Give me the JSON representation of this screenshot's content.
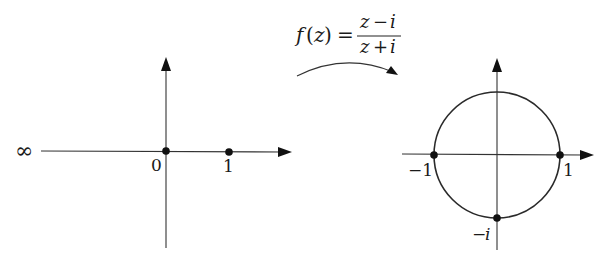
{
  "mapping": {
    "function_name": "f(z)",
    "lhs_f": "f",
    "lhs_arg": "z",
    "equals": "=",
    "numerator": "z − i",
    "numerator_parts": [
      "z",
      "−",
      "i"
    ],
    "denominator": "z + i",
    "denominator_parts": [
      "z",
      "+",
      "i"
    ],
    "arrow_direction": "left-to-right"
  },
  "domain_plane": {
    "description": "extended real line in the z-plane",
    "points": [
      {
        "value": 0,
        "label": "0"
      },
      {
        "value": 1,
        "label": "1"
      }
    ],
    "infinity_label": "∞"
  },
  "image_plane": {
    "description": "unit circle in the w-plane",
    "circle_radius": 1,
    "points": [
      {
        "value": "-1",
        "label": "−1"
      },
      {
        "value": "1",
        "label": "1"
      },
      {
        "value": "-i",
        "label": "−i",
        "label_minus": "−",
        "label_i": "i"
      }
    ]
  }
}
